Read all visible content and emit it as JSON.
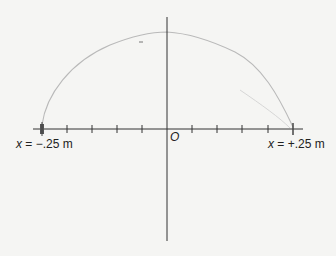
{
  "diagram": {
    "type": "coordinate-axis-with-trajectory",
    "labels": {
      "left_endpoint_var": "x",
      "left_endpoint_rest": " = −.25 m",
      "right_endpoint_var": "x",
      "right_endpoint_rest": " = +.25 m",
      "origin": "O"
    },
    "axis": {
      "x_min_m": -0.25,
      "x_max_m": 0.25,
      "tick_count": 11,
      "tick_spacing_m": 0.05
    },
    "curve": {
      "description": "faint arc from x = -.25 m rising to a peak near the vertical axis and descending to x = +.25 m",
      "color": "#b8b8b8"
    },
    "colors": {
      "axis": "#333333",
      "background": "#f5f5f3",
      "endpoint_marker": "#555555"
    }
  }
}
